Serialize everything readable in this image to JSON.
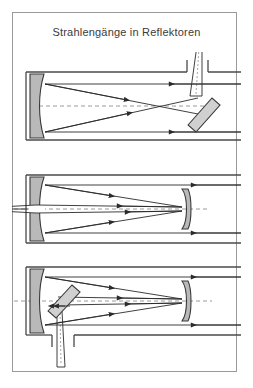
{
  "title": "Strahlengänge in Reflektoren",
  "colors": {
    "frame_border": "#9a9a9a",
    "mirror_fill": "#b9b9b9",
    "mirror_stroke": "#3a3a3a",
    "ray_stroke": "#2b2b2b",
    "tube_stroke": "#4a4a4a",
    "axis_dash": "#8f8f8f",
    "background": "#ffffff",
    "title_text": "#3b3b3b"
  },
  "figures": [
    {
      "name": "newton-reflector",
      "label": "Newton",
      "elements": {
        "primary_mirror": "concave-primary-mirror",
        "secondary_mirror": "flat-diagonal-mirror",
        "eyepiece": "eyepiece-top",
        "tube": "telescope-tube",
        "optical_axis": "dashed-optical-axis",
        "incoming_rays": 2,
        "ray_direction": "right-to-left"
      }
    },
    {
      "name": "cassegrain-reflector",
      "label": "Cassegrain",
      "elements": {
        "primary_mirror": "concave-primary-mirror-with-hole",
        "secondary_mirror": "convex-secondary-mirror",
        "eyepiece": "eyepiece-behind-primary",
        "tube": "telescope-tube",
        "optical_axis": "dashed-optical-axis",
        "incoming_rays": 2,
        "ray_direction": "right-to-left"
      }
    },
    {
      "name": "nasmyth-reflector",
      "label": "Nasmyth",
      "elements": {
        "primary_mirror": "concave-primary-mirror",
        "secondary_mirror": "convex-secondary-mirror",
        "tertiary_mirror": "flat-diagonal-mirror",
        "eyepiece": "eyepiece-bottom",
        "tube": "telescope-tube",
        "optical_axis": "dashed-optical-axis",
        "incoming_rays": 2,
        "ray_direction": "right-to-left"
      }
    }
  ]
}
